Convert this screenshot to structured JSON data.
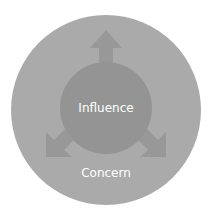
{
  "diagram": {
    "outer_circle": {
      "label": "Concern",
      "color": "#a9a9a9"
    },
    "inner_circle": {
      "label": "Influence",
      "color": "#939393"
    },
    "arrows": [
      {
        "direction": "up",
        "color": "#989898"
      },
      {
        "direction": "down-left",
        "color": "#989898"
      },
      {
        "direction": "down-right",
        "color": "#989898"
      }
    ]
  }
}
